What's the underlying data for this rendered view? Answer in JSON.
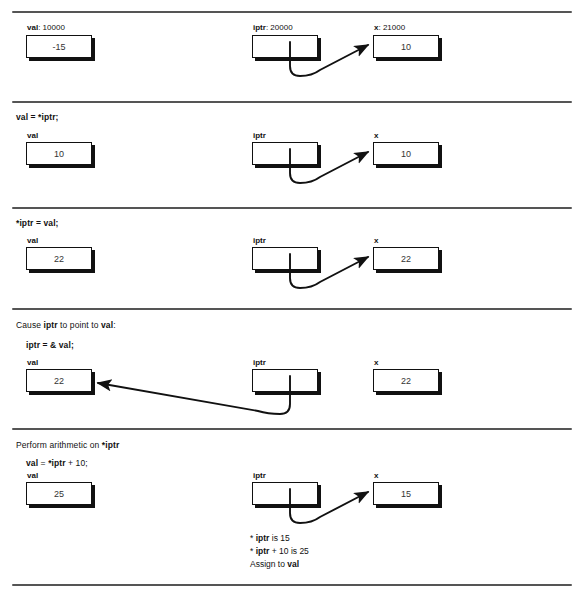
{
  "diagram": {
    "type": "pointer-memory-diagram",
    "colors": {
      "ink": "#111111",
      "rule": "#555555",
      "background": "#ffffff"
    },
    "box_labels": {
      "val": "val",
      "iptr": "iptr",
      "x": "x"
    },
    "sections": [
      {
        "id": "initial",
        "heading": "",
        "statement": "",
        "val_label": "val: 10000",
        "val_name": "val",
        "val_address": "10000",
        "val_value": "-15",
        "iptr_label": "iptr: 20000",
        "iptr_name": "iptr",
        "iptr_address": "20000",
        "x_label": "x: 21000",
        "x_name": "x",
        "x_address": "21000",
        "x_value": "10",
        "arrow": "iptr-to-x"
      },
      {
        "id": "deref-read",
        "heading": "",
        "statement": "val = *iptr;",
        "val_label": "val",
        "val_value": "10",
        "iptr_label": "iptr",
        "x_label": "x",
        "x_value": "10",
        "arrow": "iptr-to-x"
      },
      {
        "id": "deref-write",
        "heading": "",
        "statement": "*iptr = val;",
        "val_label": "val",
        "val_value": "22",
        "iptr_label": "iptr",
        "x_label": "x",
        "x_value": "22",
        "arrow": "iptr-to-x"
      },
      {
        "id": "address-of",
        "heading_prefix": "Cause ",
        "heading_bold1": "iptr",
        "heading_mid": " to point to ",
        "heading_bold2": "val",
        "heading_suffix": ":",
        "statement": "iptr = & val;",
        "val_label": "val",
        "val_value": "22",
        "iptr_label": "iptr",
        "x_label": "x",
        "x_value": "22",
        "arrow": "iptr-to-val"
      },
      {
        "id": "arithmetic",
        "heading_prefix": "Perform arithmetic on ",
        "heading_bold1": "*iptr",
        "statement_a": "val",
        "statement_b": " = ",
        "statement_c": "*iptr",
        "statement_d": " + 10;",
        "val_label": "val",
        "val_value": "25",
        "iptr_label": "iptr",
        "x_label": "x",
        "x_value": "15",
        "arrow": "iptr-to-x",
        "notes": [
          {
            "pre": "* ",
            "bold": "iptr",
            "post": " is 15"
          },
          {
            "pre": "* ",
            "bold": "iptr",
            "post": " + 10 is 25"
          },
          {
            "pre": "Assign to ",
            "bold": "val",
            "post": ""
          }
        ]
      }
    ]
  }
}
